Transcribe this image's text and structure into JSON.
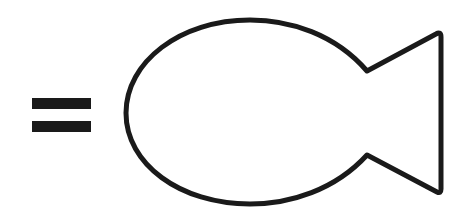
{
  "scene": {
    "description": "equals sign followed by a fish outline",
    "symbols": [
      {
        "name": "equals-sign",
        "glyph": "="
      },
      {
        "name": "fish-outline",
        "shape": "fish"
      }
    ],
    "colors": {
      "background": "#ffffff",
      "stroke": "#1a1a1a"
    }
  }
}
